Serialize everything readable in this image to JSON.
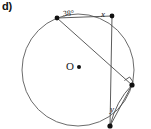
{
  "figure": {
    "part_label": "d)",
    "type": "circle-geometry-diagram",
    "center_label": "O",
    "labels": {
      "angle_at_top_left": "38°",
      "angle_at_top_right": "x",
      "angle_at_bottom": "y"
    },
    "colors": {
      "stroke": "#4a4a4a",
      "text": "#1a1a1a",
      "vertex": "#111111",
      "background": "#ffffff"
    },
    "circle": {
      "cx": 78,
      "cy": 70,
      "r": 56
    },
    "points": [
      {
        "name": "A",
        "role": "top-left-vertex",
        "x": 57,
        "y": 18
      },
      {
        "name": "B",
        "role": "top-right-vertex",
        "x": 112,
        "y": 16
      },
      {
        "name": "C",
        "role": "right-vertex-right-angle",
        "x": 132,
        "y": 85
      },
      {
        "name": "D",
        "role": "bottom-vertex",
        "x": 110,
        "y": 126
      }
    ],
    "segments": [
      {
        "name": "chord-A-B",
        "from": "A",
        "to": "B"
      },
      {
        "name": "chord-A-C",
        "from": "A",
        "to": "C"
      },
      {
        "name": "chord-B-D",
        "from": "B",
        "to": "D"
      },
      {
        "name": "chord-C-D",
        "from": "C",
        "to": "D"
      }
    ],
    "markers": {
      "right_angle_at": "C",
      "center_dot": true
    }
  }
}
